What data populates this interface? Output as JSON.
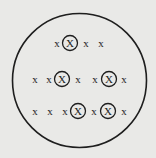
{
  "diagram": {
    "background": "#e9e9e7",
    "stroke_color": "#1e1e1e",
    "boundary": {
      "cx": 79.5,
      "cy": 80.5,
      "r": 67
    },
    "rows": [
      {
        "y": 43,
        "items": [
          {
            "x": 57,
            "label": "x",
            "circled": false
          },
          {
            "x": 70,
            "label": "X",
            "circled": true
          },
          {
            "x": 86,
            "label": "x",
            "circled": false
          },
          {
            "x": 101,
            "label": "x",
            "circled": false
          }
        ]
      },
      {
        "y": 79,
        "items": [
          {
            "x": 35,
            "label": "x",
            "circled": false
          },
          {
            "x": 49,
            "label": "x",
            "circled": false
          },
          {
            "x": 62,
            "label": "X",
            "circled": true
          },
          {
            "x": 78,
            "label": "x",
            "circled": false
          },
          {
            "x": 95,
            "label": "x",
            "circled": false
          },
          {
            "x": 109,
            "label": "X",
            "circled": true
          },
          {
            "x": 124,
            "label": "x",
            "circled": false
          }
        ]
      },
      {
        "y": 111,
        "items": [
          {
            "x": 35,
            "label": "x",
            "circled": false
          },
          {
            "x": 50,
            "label": "x",
            "circled": false
          },
          {
            "x": 65,
            "label": "x",
            "circled": false
          },
          {
            "x": 78,
            "label": "X",
            "circled": true
          },
          {
            "x": 94,
            "label": "x",
            "circled": false
          },
          {
            "x": 108,
            "label": "X",
            "circled": true
          },
          {
            "x": 124,
            "label": "x",
            "circled": false
          }
        ]
      }
    ]
  }
}
